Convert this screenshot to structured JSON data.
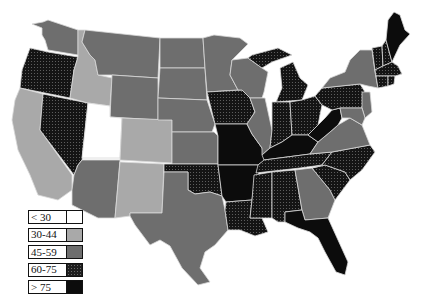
{
  "map": {
    "type": "choropleth",
    "region": "United States",
    "legend": [
      {
        "label": "< 30",
        "class": "c1",
        "color": "#ffffff"
      },
      {
        "label": "30-44",
        "class": "c2",
        "color": "#a9a9a9"
      },
      {
        "label": "45-59",
        "class": "c3",
        "color": "#6e6e6e"
      },
      {
        "label": "60-75",
        "class": "c4",
        "color": "#1f1f1f",
        "pattern": "dotted"
      },
      {
        "label": "> 75",
        "class": "c5",
        "color": "#0c0c0c"
      }
    ],
    "states": {
      "WA": "45-59",
      "OR": "60-75",
      "CA": "30-44",
      "NV": "60-75",
      "ID": "30-44",
      "MT": "45-59",
      "WY": "45-59",
      "UT": "< 30",
      "AZ": "45-59",
      "CO": "30-44",
      "NM": "30-44",
      "ND": "45-59",
      "SD": "45-59",
      "NE": "45-59",
      "KS": "45-59",
      "OK": "60-75",
      "TX": "45-59",
      "MN": "45-59",
      "IA": "60-75",
      "MO": "> 75",
      "AR": "> 75",
      "LA": "60-75",
      "WI": "45-59",
      "IL": "45-59",
      "MI": "60-75",
      "IN": "60-75",
      "OH": "60-75",
      "KY": "> 75",
      "TN": "60-75",
      "MS": "60-75",
      "AL": "60-75",
      "GA": "45-59",
      "FL": "> 75",
      "SC": "60-75",
      "NC": "60-75",
      "VA": "45-59",
      "WV": "> 75",
      "PA": "60-75",
      "NY": "45-59",
      "NJ": "45-59",
      "MD": "45-59",
      "DE": "45-59",
      "ME": "> 75",
      "VT": "60-75",
      "NH": "60-75",
      "MA": "60-75",
      "CT": "60-75",
      "RI": "60-75"
    }
  }
}
